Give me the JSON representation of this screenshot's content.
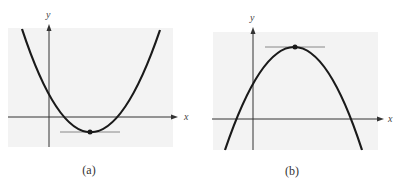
{
  "panels": [
    {
      "id": "a",
      "caption": "(a)",
      "x_label": "x",
      "y_label": "y",
      "curve": "upward parabola",
      "extremum": "minimum",
      "tangent": "horizontal tangent line at minimum point"
    },
    {
      "id": "b",
      "caption": "(b)",
      "x_label": "x",
      "y_label": "y",
      "curve": "downward parabola",
      "extremum": "maximum",
      "tangent": "horizontal tangent line at maximum point"
    }
  ],
  "colors": {
    "background_panel": "#f3f3f3",
    "curve": "#1a1a1a",
    "tangent": "#888888",
    "axis": "#333333"
  }
}
